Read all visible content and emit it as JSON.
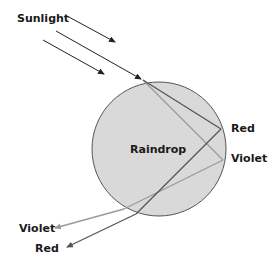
{
  "diagram": {
    "labels": {
      "sunlight": "Sunlight",
      "raindrop": "Raindrop",
      "red_internal": "Red",
      "violet_internal": "Violet",
      "violet_exit": "Violet",
      "red_exit": "Red"
    },
    "colors": {
      "drop_fill": "#d9d9d9",
      "drop_stroke": "#555555",
      "sun_ray": "#222222",
      "red_ray": "#555555",
      "violet_ray": "#9a9a9a"
    }
  }
}
